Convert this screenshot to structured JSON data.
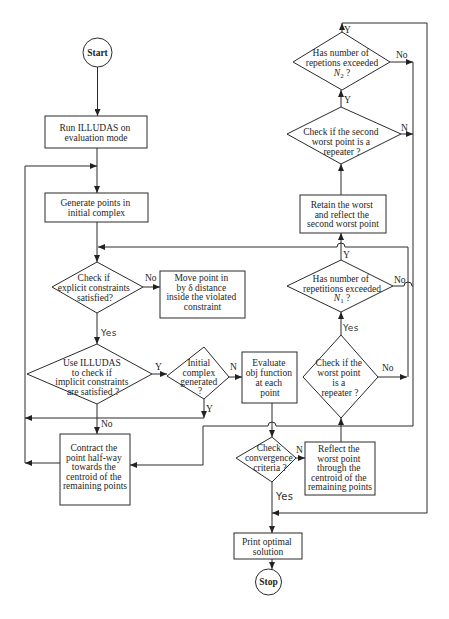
{
  "diagram": {
    "type": "flowchart",
    "nodes": {
      "start": {
        "label": "Start"
      },
      "run_illudas": {
        "lines": [
          "Run ILLUDAS on",
          "evaluation mode"
        ]
      },
      "generate_points": {
        "lines": [
          "Generate points in",
          "initial complex"
        ]
      },
      "check_explicit": {
        "lines": [
          "Check if",
          "explicit constraints",
          "satisfied?"
        ]
      },
      "move_point": {
        "lines": [
          "Move point in",
          "by δ distance",
          "inside the violated",
          "constraint"
        ]
      },
      "check_implicit": {
        "lines": [
          "Use ILLUDAS",
          "to check if",
          "implicit constraints",
          "are satisfied ?"
        ]
      },
      "initial_complex": {
        "lines": [
          "Initial",
          "complex",
          "generated",
          "?"
        ]
      },
      "evaluate_obj": {
        "lines": [
          "Evaluate",
          "obj function",
          "at each",
          "point"
        ]
      },
      "contract_point": {
        "lines": [
          "Contract the",
          "point half-way",
          "towards the",
          "centroid of the",
          "remaining points"
        ]
      },
      "check_convergence": {
        "lines": [
          "Check",
          "convergence",
          "criteria ?"
        ]
      },
      "reflect_worst": {
        "lines": [
          "Reflect the",
          "worst point",
          "through the",
          "centroid of the",
          "remaining points"
        ]
      },
      "print_solution": {
        "lines": [
          "Print optimal",
          "solution"
        ]
      },
      "stop": {
        "label": "Stop"
      },
      "worst_repeater": {
        "lines": [
          "Check if the",
          "worst point",
          "is a",
          "repeater ?"
        ]
      },
      "n1_exceeded": {
        "lines": [
          "Has number of",
          "repetitions exceeded"
        ],
        "var": "N",
        "sub": "1",
        "suffix": " ?"
      },
      "retain_worst": {
        "lines": [
          "Retain the worst",
          "and reflect the",
          "second worst point"
        ]
      },
      "second_worst_repeater": {
        "lines": [
          "Check if the second",
          "worst point is a",
          "repeater ?"
        ]
      },
      "n2_exceeded": {
        "lines": [
          "Has number of",
          "repetions exceeded"
        ],
        "var": "N",
        "sub": "2",
        "suffix": " ?"
      }
    },
    "edge_labels": {
      "explicit_no": "No",
      "explicit_yes": "Yes",
      "implicit_yes": "Y",
      "implicit_no": "No",
      "initial_no": "N",
      "initial_yes": "Y",
      "convergence_no": "N",
      "convergence_yes": "Yes",
      "worst_yes": "Yes",
      "worst_no": "No",
      "n1_yes": "Y",
      "n1_no": "No",
      "second_yes": "Y",
      "second_no": "N",
      "n2_yes": "Y",
      "n2_no": "No"
    }
  },
  "colors": {
    "line": "#2a2a2a",
    "text": "#1e1e1e",
    "background": "#ffffff"
  }
}
